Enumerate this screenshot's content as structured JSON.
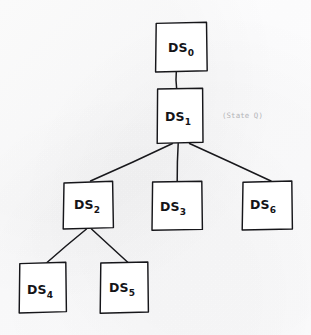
{
  "diagram": {
    "kind": "hand-drawn-tree-diagram",
    "title_visible": false,
    "background_color": "#fdfdfd",
    "stroke_color": "#16161a",
    "box_fill_color": "#ffffff",
    "annotation_color": "#b4b4b8",
    "nodes": [
      {
        "id": "ds0",
        "label_base": "DS",
        "label_subscript": "0",
        "label_full": "DS0",
        "level": 0,
        "box": {
          "x": 155,
          "y": 22,
          "w": 52,
          "h": 50
        },
        "label_pos": {
          "x": 168,
          "y": 52
        }
      },
      {
        "id": "ds1",
        "label_base": "DS",
        "label_subscript": "1",
        "label_full": "DS1",
        "level": 1,
        "box": {
          "x": 157,
          "y": 88,
          "w": 46,
          "h": 55
        },
        "label_pos": {
          "x": 165,
          "y": 121
        }
      },
      {
        "id": "ds2",
        "label_base": "DS",
        "label_subscript": "2",
        "label_full": "DS2",
        "level": 2,
        "box": {
          "x": 63,
          "y": 181,
          "w": 50,
          "h": 48
        },
        "label_pos": {
          "x": 74,
          "y": 209
        }
      },
      {
        "id": "ds3",
        "label_base": "DS",
        "label_subscript": "3",
        "label_full": "DS3",
        "level": 2,
        "box": {
          "x": 152,
          "y": 181,
          "w": 50,
          "h": 49
        },
        "label_pos": {
          "x": 160,
          "y": 211
        }
      },
      {
        "id": "ds6",
        "label_base": "DS",
        "label_subscript": "6",
        "label_full": "DS6",
        "level": 2,
        "box": {
          "x": 242,
          "y": 181,
          "w": 50,
          "h": 49
        },
        "label_pos": {
          "x": 250,
          "y": 209
        }
      },
      {
        "id": "ds4",
        "label_base": "DS",
        "label_subscript": "4",
        "label_full": "DS4",
        "level": 3,
        "box": {
          "x": 19,
          "y": 262,
          "w": 47,
          "h": 51
        },
        "label_pos": {
          "x": 27,
          "y": 294
        }
      },
      {
        "id": "ds5",
        "label_base": "DS",
        "label_subscript": "5",
        "label_full": "DS5",
        "level": 3,
        "box": {
          "x": 100,
          "y": 262,
          "w": 48,
          "h": 51
        },
        "label_pos": {
          "x": 109,
          "y": 292
        }
      }
    ],
    "edges": [
      {
        "id": "edge-ds0-ds1",
        "from": "ds0",
        "to": "ds1",
        "x1": 176,
        "y1": 72,
        "x2": 177,
        "y2": 88
      },
      {
        "id": "edge-ds1-ds2",
        "from": "ds1",
        "to": "ds2",
        "x1": 172,
        "y1": 143,
        "x2": 90,
        "y2": 181
      },
      {
        "id": "edge-ds1-ds3",
        "from": "ds1",
        "to": "ds3",
        "x1": 178,
        "y1": 143,
        "x2": 177,
        "y2": 181
      },
      {
        "id": "edge-ds1-ds6",
        "from": "ds1",
        "to": "ds6",
        "x1": 190,
        "y1": 143,
        "x2": 271,
        "y2": 181
      },
      {
        "id": "edge-ds2-ds4",
        "from": "ds2",
        "to": "ds4",
        "x1": 86,
        "y1": 229,
        "x2": 47,
        "y2": 262
      },
      {
        "id": "edge-ds2-ds5",
        "from": "ds2",
        "to": "ds5",
        "x1": 91,
        "y1": 229,
        "x2": 128,
        "y2": 262
      }
    ],
    "annotations": [
      {
        "id": "state-q-note",
        "text": "(State Q)",
        "refers_to": "ds1",
        "pos": {
          "x": 222,
          "y": 118
        }
      }
    ]
  }
}
